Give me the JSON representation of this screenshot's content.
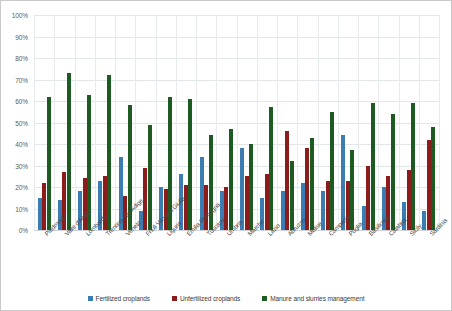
{
  "chart_data": {
    "type": "bar",
    "title": "",
    "xlabel": "",
    "ylabel": "",
    "ylim": [
      0,
      100
    ],
    "grid": true,
    "legend_position": "bottom",
    "y_ticks": [
      "0%",
      "10%",
      "20%",
      "30%",
      "40%",
      "50%",
      "60%",
      "70%",
      "80%",
      "90%",
      "100%"
    ],
    "y_tick_values": [
      0,
      10,
      20,
      30,
      40,
      50,
      60,
      70,
      80,
      90,
      100
    ],
    "categories": [
      "Piedmont",
      "Valle d'Aosta",
      "Lombardy",
      "Trentino Alto Adige",
      "Veneto",
      "Friuli Venezia Giulia",
      "Liguria",
      "Emilia Romagna",
      "Tuscany",
      "Umbria",
      "Marche",
      "Lazio",
      "Abruzzo",
      "Molise",
      "Campania",
      "Puglia",
      "Basilicata",
      "Calabria",
      "Sicily",
      "Sardinia"
    ],
    "series": [
      {
        "name": "Fertilized croplands",
        "color": "#3B7CB3",
        "values": [
          15,
          14,
          18,
          23,
          34,
          9,
          20,
          26,
          34,
          18,
          38,
          15,
          18,
          22,
          18,
          44,
          11,
          20,
          13,
          9
        ]
      },
      {
        "name": "Unfertilized croplands",
        "color": "#8C1C1C",
        "values": [
          22,
          27,
          24,
          25,
          16,
          29,
          19,
          21,
          21,
          20,
          25,
          26,
          46,
          38,
          23,
          23,
          30,
          25,
          28,
          42
        ]
      },
      {
        "name": "Manure and slurries management",
        "color": "#1E5B22",
        "values": [
          62,
          73,
          63,
          72,
          58,
          49,
          62,
          61,
          44,
          47,
          40,
          57,
          32,
          43,
          55,
          37,
          59,
          54,
          59,
          48
        ]
      }
    ]
  },
  "legend": {
    "entries": [
      {
        "label": "Fertilized croplands",
        "color": "#3B7CB3"
      },
      {
        "label": "Unfertilized croplands",
        "color": "#8C1C1C"
      },
      {
        "label": "Manure and slurries management",
        "color": "#1E5B22"
      }
    ]
  }
}
